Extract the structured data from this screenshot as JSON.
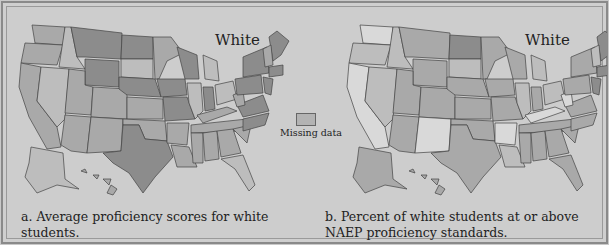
{
  "legend": {
    "label": "Missing data",
    "swatch_color": "#b3b3b3"
  },
  "panels": [
    {
      "id": "a",
      "title": "White",
      "caption_line1": "a. Average proficiency scores for white",
      "caption_line2": "students.",
      "shade_key": {
        "dark": "#8c8c8c",
        "medium": "#a9a9a9",
        "light": "#bdbdbd"
      }
    },
    {
      "id": "b",
      "title": "White",
      "caption_line1": "b. Percent of white students at or above",
      "caption_line2": "NAEP proficiency standards.",
      "shade_key": {
        "dark": "#8c8c8c",
        "medium": "#a9a9a9",
        "light": "#bdbdbd",
        "lightest": "#d9d9d9"
      }
    }
  ]
}
